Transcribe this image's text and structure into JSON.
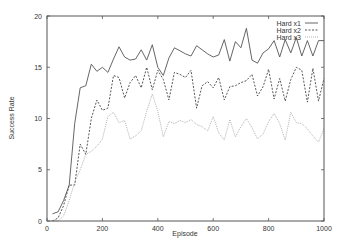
{
  "chart_data": {
    "type": "line",
    "title": "",
    "xlabel": "Episode",
    "ylabel": "Success Rate",
    "xlim": [
      0,
      1000
    ],
    "ylim": [
      0,
      20
    ],
    "xticks": [
      0,
      200,
      400,
      600,
      800,
      1000
    ],
    "yticks": [
      0,
      5,
      10,
      15,
      20
    ],
    "grid": false,
    "legend_position": "upper right",
    "x": [
      20,
      40,
      60,
      80,
      100,
      120,
      140,
      160,
      180,
      200,
      220,
      240,
      260,
      280,
      300,
      320,
      340,
      360,
      380,
      400,
      420,
      440,
      460,
      480,
      500,
      520,
      540,
      560,
      580,
      600,
      620,
      640,
      660,
      680,
      700,
      720,
      740,
      760,
      780,
      800,
      820,
      840,
      860,
      880,
      900,
      920,
      940,
      960,
      980,
      1000
    ],
    "series": [
      {
        "name": "Hard x1",
        "style": "solid",
        "color": "#555555",
        "values": [
          0.7,
          0.9,
          2.0,
          3.5,
          9.5,
          13.0,
          13.2,
          15.3,
          14.6,
          15.0,
          14.5,
          15.8,
          17.0,
          16.0,
          15.7,
          15.8,
          16.7,
          15.7,
          17.2,
          15.0,
          14.2,
          15.9,
          16.9,
          16.6,
          16.3,
          16.1,
          17.1,
          16.7,
          16.3,
          16.0,
          16.2,
          17.7,
          15.6,
          17.5,
          16.9,
          18.8,
          15.7,
          15.4,
          16.4,
          16.8,
          17.6,
          16.0,
          17.7,
          16.4,
          17.9,
          16.1,
          17.6,
          16.1,
          17.6,
          17.6
        ]
      },
      {
        "name": "Hard x2",
        "style": "dashed",
        "color": "#444444",
        "values": [
          0.0,
          0.3,
          1.5,
          3.5,
          3.5,
          7.5,
          6.5,
          10.0,
          11.8,
          10.8,
          11.0,
          14.2,
          14.0,
          12.0,
          13.5,
          14.2,
          13.0,
          15.0,
          12.8,
          14.7,
          13.8,
          11.8,
          14.5,
          14.3,
          14.0,
          14.7,
          11.0,
          13.2,
          13.6,
          13.0,
          14.0,
          11.8,
          13.1,
          13.2,
          13.5,
          13.7,
          14.3,
          12.2,
          13.1,
          14.8,
          11.9,
          13.9,
          11.7,
          13.8,
          15.0,
          14.7,
          11.6,
          14.9,
          11.7,
          13.9
        ]
      },
      {
        "name": "Hard x3",
        "style": "dotted",
        "color": "#aaaaaa",
        "values": [
          0.0,
          0.0,
          0.5,
          2.0,
          3.8,
          5.0,
          6.5,
          6.8,
          7.3,
          8.0,
          10.2,
          10.6,
          9.6,
          9.8,
          8.0,
          8.3,
          8.8,
          10.7,
          12.4,
          10.7,
          8.2,
          9.7,
          9.5,
          9.8,
          9.6,
          9.9,
          9.4,
          9.2,
          8.8,
          10.2,
          8.6,
          7.9,
          9.9,
          8.2,
          9.2,
          10.0,
          9.1,
          8.0,
          8.5,
          9.7,
          10.5,
          9.5,
          7.9,
          10.6,
          9.6,
          9.5,
          9.0,
          8.3,
          7.7,
          9.0
        ]
      }
    ]
  }
}
